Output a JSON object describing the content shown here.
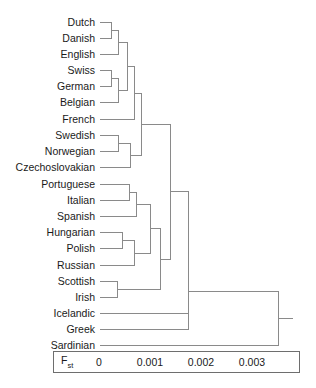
{
  "figure": {
    "type": "dendrogram",
    "title": "",
    "width": 316,
    "height": 388,
    "line_color": "#8a8a8a",
    "text_color": "#1a1a1a",
    "box_color": "#6e6e6e"
  },
  "axis": {
    "metric_label": "F",
    "metric_sub": "st",
    "ticks": [
      "0",
      "0.001",
      "0.002",
      "0.003"
    ],
    "tick_values": [
      0,
      0.001,
      0.002,
      0.003
    ],
    "range": [
      0,
      0.00425
    ],
    "box": {
      "x": 53,
      "y": 351,
      "width": 247,
      "height": 22
    },
    "x0_px": 99,
    "px_per_unit": 51000
  },
  "chart_data": {
    "type": "dendrogram",
    "title": "",
    "xlabel": "Fst",
    "ylabel": "",
    "grid": false,
    "legend": "none",
    "xlim": [
      0,
      0.00425
    ],
    "leaves": [
      "Dutch",
      "Danish",
      "English",
      "Swiss",
      "German",
      "Belgian",
      "French",
      "Swedish",
      "Norwegian",
      "Czechoslovakian",
      "Portuguese",
      "Italian",
      "Spanish",
      "Hungarian",
      "Polish",
      "Russian",
      "Scottish",
      "Irish",
      "Icelandic",
      "Greek",
      "Sardinian"
    ],
    "leaf_rows": [
      {
        "label": "Dutch",
        "y": 22
      },
      {
        "label": "Danish",
        "y": 38
      },
      {
        "label": "English",
        "y": 54
      },
      {
        "label": "Swiss",
        "y": 70
      },
      {
        "label": "German",
        "y": 86
      },
      {
        "label": "Belgian",
        "y": 102
      },
      {
        "label": "French",
        "y": 119
      },
      {
        "label": "Swedish",
        "y": 135
      },
      {
        "label": "Norwegian",
        "y": 151
      },
      {
        "label": "Czechoslovakian",
        "y": 167
      },
      {
        "label": "Portuguese",
        "y": 184
      },
      {
        "label": "Italian",
        "y": 200
      },
      {
        "label": "Spanish",
        "y": 216
      },
      {
        "label": "Hungarian",
        "y": 232
      },
      {
        "label": "Polish",
        "y": 248
      },
      {
        "label": "Russian",
        "y": 265
      },
      {
        "label": "Scottish",
        "y": 281
      },
      {
        "label": "Irish",
        "y": 297
      },
      {
        "label": "Icelandic",
        "y": 313
      },
      {
        "label": "Greek",
        "y": 329
      },
      {
        "label": "Sardinian",
        "y": 345
      }
    ],
    "merges": [
      {
        "id": "n1",
        "children": [
          "Dutch",
          "Danish"
        ],
        "x_px": 111,
        "fst": 0.00024
      },
      {
        "id": "n2",
        "children": [
          "n1",
          "English"
        ],
        "x_px": 118,
        "fst": 0.00037
      },
      {
        "id": "n3",
        "children": [
          "Swiss",
          "German"
        ],
        "x_px": 111,
        "fst": 0.00024
      },
      {
        "id": "n4",
        "children": [
          "n3",
          "Belgian"
        ],
        "x_px": 118,
        "fst": 0.00037
      },
      {
        "id": "n5",
        "children": [
          "n2",
          "n4"
        ],
        "x_px": 127,
        "fst": 0.00055
      },
      {
        "id": "n6",
        "children": [
          "n5",
          "French"
        ],
        "x_px": 134,
        "fst": 0.00069
      },
      {
        "id": "n7",
        "children": [
          "Swedish",
          "Norwegian"
        ],
        "x_px": 118,
        "fst": 0.00037
      },
      {
        "id": "n8",
        "children": [
          "n7",
          "Czechoslovakian"
        ],
        "x_px": 130,
        "fst": 0.00061
      },
      {
        "id": "n9",
        "children": [
          "n6",
          "n8"
        ],
        "x_px": 141,
        "fst": 0.00082
      },
      {
        "id": "n10",
        "children": [
          "Portuguese",
          "Italian"
        ],
        "x_px": 129,
        "fst": 0.00059
      },
      {
        "id": "n11",
        "children": [
          "n10",
          "Spanish"
        ],
        "x_px": 136,
        "fst": 0.00073
      },
      {
        "id": "n12",
        "children": [
          "Hungarian",
          "Polish"
        ],
        "x_px": 122,
        "fst": 0.00045
      },
      {
        "id": "n13",
        "children": [
          "n12",
          "Russian"
        ],
        "x_px": 134,
        "fst": 0.00069
      },
      {
        "id": "n14",
        "children": [
          "n11",
          "n13"
        ],
        "x_px": 150,
        "fst": 0.001
      },
      {
        "id": "n15",
        "children": [
          "Scottish",
          "Irish"
        ],
        "x_px": 117,
        "fst": 0.00035
      },
      {
        "id": "n16",
        "children": [
          "n14",
          "n15"
        ],
        "x_px": 160,
        "fst": 0.0012
      },
      {
        "id": "n17",
        "children": [
          "n9",
          "n16"
        ],
        "x_px": 170,
        "fst": 0.00139
      },
      {
        "id": "n18",
        "children": [
          "n17",
          "Icelandic"
        ],
        "x_px": 188,
        "fst": 0.00175
      },
      {
        "id": "n19",
        "children": [
          "n18",
          "Greek"
        ],
        "x_px": 188,
        "fst": 0.00175
      },
      {
        "id": "n20",
        "children": [
          "n19",
          "Sardinian"
        ],
        "x_px": 278,
        "fst": 0.00351
      }
    ]
  }
}
